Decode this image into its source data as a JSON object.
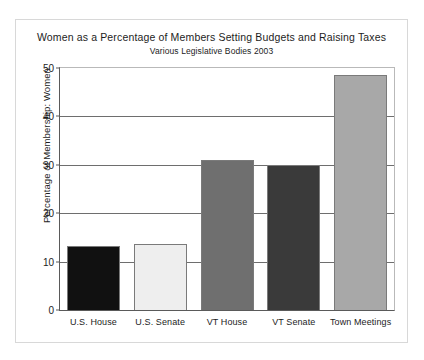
{
  "chart_data": {
    "type": "bar",
    "title": "Women as a Percentage of Members Setting Budgets and Raising Taxes",
    "subtitle": "Various Legislative Bodies 2003",
    "xlabel": "",
    "ylabel": "Percentage of Membership: Women",
    "categories": [
      "U.S. House",
      "U.S. Senate",
      "VT House",
      "VT Senate",
      "Town Meetings"
    ],
    "values": [
      13.2,
      13.6,
      31.0,
      30.0,
      48.5
    ],
    "bar_colors": [
      "#111111",
      "#eeeeee",
      "#6f6f6f",
      "#3a3a3a",
      "#a8a8a8"
    ],
    "bar_border_color": "#7a7a7a",
    "ylim": [
      0,
      50
    ],
    "yticks": [
      0,
      10,
      20,
      30,
      40,
      50
    ],
    "ytick_labels": [
      "0",
      "10",
      "20",
      "30",
      "40",
      "50"
    ],
    "grid": true,
    "legend": "none",
    "axis_color": "#5a5a5a",
    "background": "#ffffff"
  }
}
